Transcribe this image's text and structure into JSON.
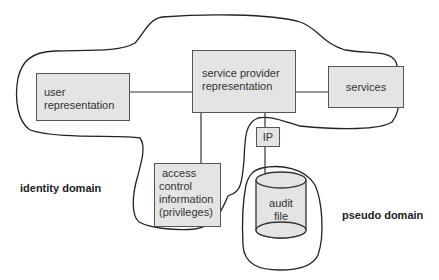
{
  "diagram": {
    "nodes": {
      "user_representation": {
        "line1": "user",
        "line2": "representation"
      },
      "service_provider_representation": {
        "line1": "service provider",
        "line2": "representation"
      },
      "services": {
        "label": "services"
      },
      "ip": {
        "label": "IP"
      },
      "access_control": {
        "line1": "access",
        "line2": "control",
        "line3": "information",
        "line4": "(privileges)"
      },
      "audit_file": {
        "line1": "audit",
        "line2": "file"
      }
    },
    "domains": {
      "identity": "identity domain",
      "pseudo": "pseudo domain"
    },
    "edges": [
      {
        "from": "user_representation",
        "to": "service_provider_representation"
      },
      {
        "from": "service_provider_representation",
        "to": "services"
      },
      {
        "from": "service_provider_representation",
        "to": "access_control"
      },
      {
        "from": "service_provider_representation",
        "to": "ip"
      },
      {
        "from": "ip",
        "to": "audit_file"
      }
    ],
    "colors": {
      "box_fill": "#e4e4e4",
      "stroke": "#333333"
    }
  }
}
